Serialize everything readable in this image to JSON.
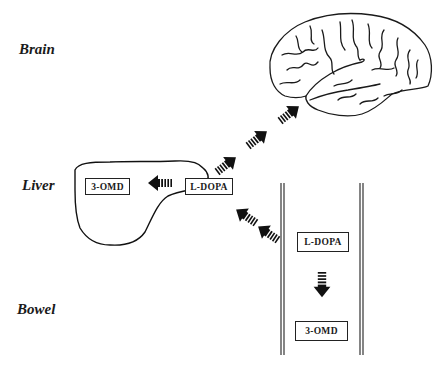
{
  "labels": {
    "brain": "Brain",
    "liver": "Liver",
    "bowel": "Bowel"
  },
  "liver": {
    "source_box": "L-DOPA",
    "product_box": "3-OMD"
  },
  "bowel": {
    "source_box": "L-DOPA",
    "product_box": "3-OMD"
  },
  "arrows": [
    {
      "from": "liver-L-DOPA",
      "to": "liver-3-OMD",
      "direction": "left"
    },
    {
      "from": "bowel-L-DOPA",
      "to": "bowel-3-OMD",
      "direction": "down"
    },
    {
      "from": "bowel",
      "to": "liver-L-DOPA",
      "direction": "up-left"
    },
    {
      "from": "liver-L-DOPA",
      "to": "brain",
      "direction": "up-right"
    }
  ]
}
